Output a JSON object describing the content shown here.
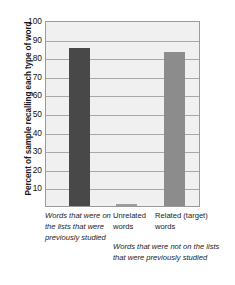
{
  "chart_data": {
    "type": "bar",
    "title": "",
    "xlabel": "",
    "ylabel": "Percent of sample recalling each type of word",
    "ylim": [
      0,
      100
    ],
    "yticks": [
      10,
      20,
      30,
      40,
      50,
      60,
      70,
      80,
      90,
      100
    ],
    "grid": true,
    "legend": "none",
    "categories": [
      "Words that were on the lists that were previously studied",
      "Unrelated words",
      "Related (target) words"
    ],
    "values": [
      85,
      1,
      83
    ],
    "bar_colors": [
      "#484848",
      "#9d9d9d",
      "#8c8c8c"
    ],
    "annotations": [
      "Words that were not on the lists that were previously studied"
    ]
  },
  "axis": {
    "y_title": "Percent of sample recalling each type of word",
    "tick_labels": [
      "100",
      "90",
      "80",
      "70",
      "60",
      "50",
      "40",
      "30",
      "20",
      "10"
    ]
  },
  "caption": {
    "group_1": "Words that were on the lists that were previously studied",
    "group_2": "Unrelated words",
    "group_3": "Related (target) words",
    "group_note": "Words that were not on the lists that were previously studied"
  },
  "credit": {
    "text": "© Cengage Learning"
  },
  "colors": {
    "plot_background": "#f0f0f0",
    "gridline": "#a8a8a8",
    "axis_border": "#9a9a9a",
    "bar_dark": "#484848",
    "bar_light": "#8c8c8c",
    "text": "#1a1a1a",
    "credit_text": "#8d8d8d"
  }
}
